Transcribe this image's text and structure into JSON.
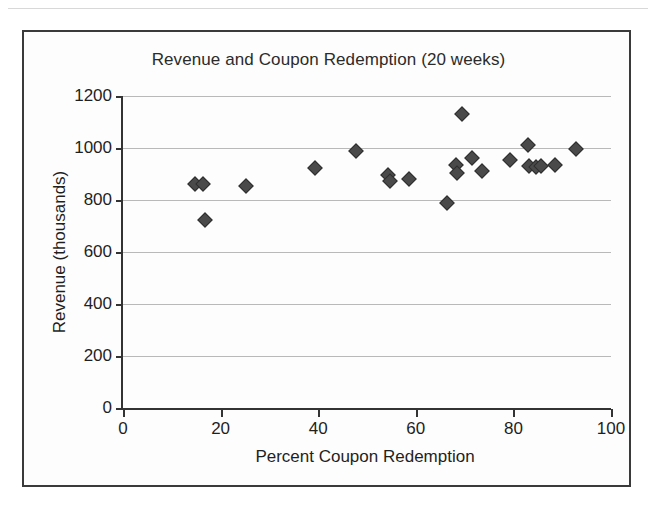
{
  "chart_data": {
    "type": "scatter",
    "title": "Revenue and Coupon Redemption (20 weeks)",
    "xlabel": "Percent Coupon Redemption",
    "ylabel": "Revenue (thousands)",
    "xlim": [
      0,
      100
    ],
    "ylim": [
      0,
      1200
    ],
    "xticks": [
      0,
      20,
      40,
      60,
      80,
      100
    ],
    "yticks": [
      0,
      200,
      400,
      600,
      800,
      1000,
      1200
    ],
    "grid": "horizontal",
    "legend": "none",
    "marker": "diamond",
    "marker_color": "#4a4a4a",
    "series": [
      {
        "name": "Weekly revenue vs coupon redemption",
        "points": [
          {
            "x": 14.8,
            "y": 862
          },
          {
            "x": 16.3,
            "y": 860
          },
          {
            "x": 16.9,
            "y": 725
          },
          {
            "x": 25.2,
            "y": 852
          },
          {
            "x": 39.4,
            "y": 925
          },
          {
            "x": 47.8,
            "y": 988
          },
          {
            "x": 54.3,
            "y": 895
          },
          {
            "x": 54.8,
            "y": 873
          },
          {
            "x": 58.6,
            "y": 880
          },
          {
            "x": 66.4,
            "y": 790
          },
          {
            "x": 69.4,
            "y": 1130
          },
          {
            "x": 68.2,
            "y": 935
          },
          {
            "x": 68.5,
            "y": 905
          },
          {
            "x": 71.6,
            "y": 960
          },
          {
            "x": 73.5,
            "y": 912
          },
          {
            "x": 79.3,
            "y": 955
          },
          {
            "x": 82.9,
            "y": 1012
          },
          {
            "x": 83.1,
            "y": 930
          },
          {
            "x": 84.6,
            "y": 928
          },
          {
            "x": 85.7,
            "y": 932
          },
          {
            "x": 88.5,
            "y": 935
          },
          {
            "x": 92.8,
            "y": 998
          }
        ]
      }
    ]
  }
}
